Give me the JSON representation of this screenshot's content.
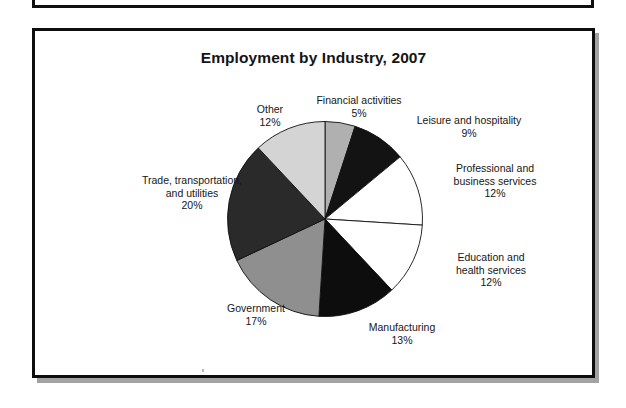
{
  "chart_data": {
    "type": "pie",
    "title": "Employment by Industry, 2007",
    "xlabel": "",
    "ylabel": "",
    "legend_position": "none",
    "grid": false,
    "start_angle_deg": 0,
    "direction": "clockwise",
    "units": "percent",
    "categories": [
      "Financial activities",
      "Leisure and hospitality",
      "Professional and business services",
      "Education and health services",
      "Manufacturing",
      "Government",
      "Trade, transportation, and utilities",
      "Other"
    ],
    "values": [
      5,
      9,
      12,
      12,
      13,
      17,
      20,
      12
    ],
    "slices": [
      {
        "label": "Financial activities",
        "label_line1": "Financial activities",
        "value": 5,
        "pct_text": "5%",
        "color": "#b0b0b0",
        "stroke": "#111111"
      },
      {
        "label": "Leisure and hospitality",
        "label_line1": "Leisure and hospitality",
        "value": 9,
        "pct_text": "9%",
        "color": "#131313",
        "stroke": "#111111"
      },
      {
        "label": "Professional and business services",
        "label_line1": "Professional and",
        "label_line2": "business services",
        "value": 12,
        "pct_text": "12%",
        "color": "#ffffff",
        "stroke": "#111111"
      },
      {
        "label": "Education and health services",
        "label_line1": "Education and",
        "label_line2": "health services",
        "value": 12,
        "pct_text": "12%",
        "color": "#ffffff",
        "stroke": "#111111"
      },
      {
        "label": "Manufacturing",
        "label_line1": "Manufacturing",
        "value": 13,
        "pct_text": "13%",
        "color": "#0d0d0d",
        "stroke": "#111111"
      },
      {
        "label": "Government",
        "label_line1": "Government",
        "value": 17,
        "pct_text": "17%",
        "color": "#8f8f8f",
        "stroke": "#111111"
      },
      {
        "label": "Trade, transportation, and utilities",
        "label_line1": "Trade, transportation,",
        "label_line2": "and utilities",
        "value": 20,
        "pct_text": "20%",
        "color": "#2a2a2a",
        "stroke": "#111111"
      },
      {
        "label": "Other",
        "label_line1": "Other",
        "value": 12,
        "pct_text": "12%",
        "color": "#d4d4d4",
        "stroke": "#111111"
      }
    ]
  },
  "colors": {
    "frame_border": "#0d0d0d",
    "frame_shadow": "#a2a2a2",
    "page_background": "#ffffff",
    "text": "#161616"
  }
}
